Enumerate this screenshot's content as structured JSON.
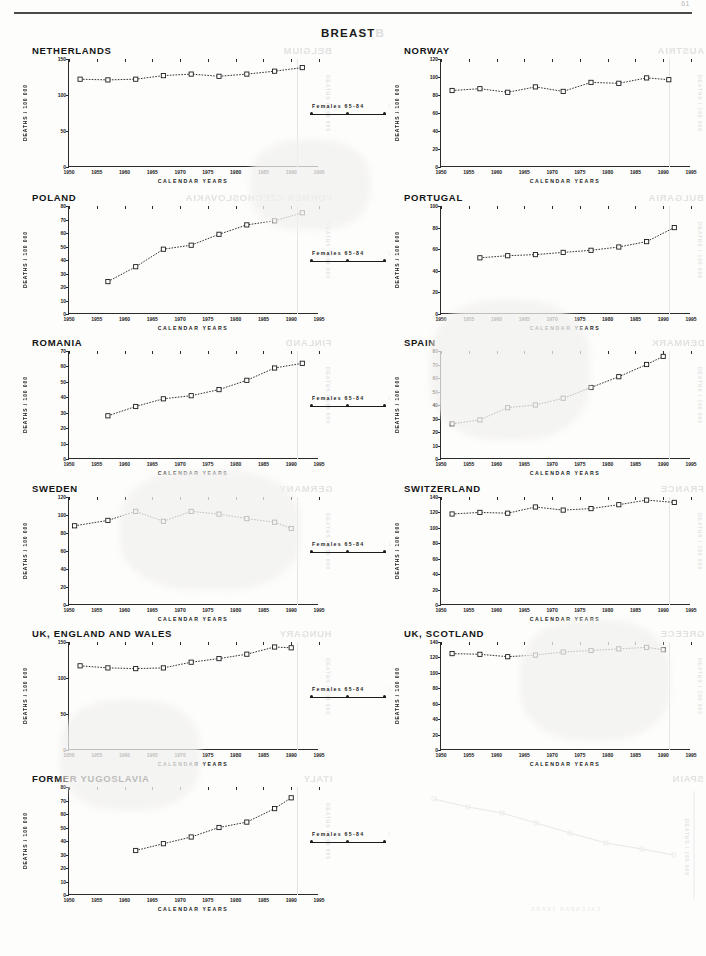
{
  "page": {
    "number": "61",
    "sheet_title": "BREAST",
    "sheet_title_ghost": "B",
    "axis_y_label": "DEATHS / 100 000",
    "axis_x_label": "CALENDAR YEARS",
    "legend_label": "Females 65-84",
    "ink_color": "#1c1c1c",
    "ghost_color": "#e3e3e3"
  },
  "chart_data": [
    {
      "type": "line",
      "title": "NETHERLANDS",
      "ghost_title": "BELGIUM",
      "xlabel": "CALENDAR YEARS",
      "ylabel": "DEATHS / 100 000",
      "xlim": [
        1950,
        1995
      ],
      "ylim": [
        0,
        150
      ],
      "yticks": [
        0,
        50,
        100,
        150
      ],
      "xticks": [
        1950,
        1955,
        1960,
        1965,
        1970,
        1975,
        1980,
        1985,
        1990,
        1995
      ],
      "series": [
        {
          "name": "Females 65-84",
          "x": [
            1952,
            1957,
            1962,
            1967,
            1972,
            1977,
            1982,
            1987,
            1992
          ],
          "values": [
            122,
            121,
            122,
            127,
            129,
            126,
            129,
            133,
            138
          ]
        }
      ]
    },
    {
      "type": "line",
      "title": "NORWAY",
      "ghost_title": "AUSTRIA",
      "xlabel": "CALENDAR YEARS",
      "ylabel": "DEATHS / 100 000",
      "xlim": [
        1950,
        1995
      ],
      "ylim": [
        0,
        120
      ],
      "yticks": [
        0,
        20,
        40,
        60,
        80,
        100,
        120
      ],
      "xticks": [
        1950,
        1955,
        1960,
        1965,
        1970,
        1975,
        1980,
        1985,
        1990,
        1995
      ],
      "series": [
        {
          "name": "Females 65-84",
          "x": [
            1952,
            1957,
            1962,
            1967,
            1972,
            1977,
            1982,
            1987,
            1991
          ],
          "values": [
            85,
            87,
            83,
            89,
            84,
            94,
            93,
            99,
            97
          ]
        }
      ]
    },
    {
      "type": "line",
      "title": "POLAND",
      "ghost_title": "FORMER CZECHOSLOVAKIA",
      "xlabel": "CALENDAR YEARS",
      "ylabel": "DEATHS / 100 000",
      "xlim": [
        1950,
        1995
      ],
      "ylim": [
        0,
        80
      ],
      "yticks": [
        0,
        10,
        20,
        30,
        40,
        50,
        60,
        70,
        80
      ],
      "xticks": [
        1950,
        1955,
        1960,
        1965,
        1970,
        1975,
        1980,
        1985,
        1990,
        1995
      ],
      "series": [
        {
          "name": "Females 65-84",
          "x": [
            1957,
            1962,
            1967,
            1972,
            1977,
            1982,
            1987,
            1992
          ],
          "values": [
            24,
            35,
            48,
            51,
            59,
            66,
            69,
            75
          ]
        }
      ]
    },
    {
      "type": "line",
      "title": "PORTUGAL",
      "ghost_title": "BULGARIA",
      "xlabel": "CALENDAR YEARS",
      "ylabel": "DEATHS / 100 000",
      "xlim": [
        1950,
        1995
      ],
      "ylim": [
        0,
        100
      ],
      "yticks": [
        0,
        20,
        40,
        60,
        80,
        100
      ],
      "xticks": [
        1950,
        1955,
        1960,
        1965,
        1970,
        1975,
        1980,
        1985,
        1990,
        1995
      ],
      "series": [
        {
          "name": "Females 65-84",
          "x": [
            1957,
            1962,
            1967,
            1972,
            1977,
            1982,
            1987,
            1992
          ],
          "values": [
            52,
            54,
            55,
            57,
            59,
            62,
            67,
            80
          ]
        }
      ]
    },
    {
      "type": "line",
      "title": "ROMANIA",
      "ghost_title": "FINLAND",
      "xlabel": "CALENDAR YEARS",
      "ylabel": "DEATHS / 100 000",
      "xlim": [
        1950,
        1995
      ],
      "ylim": [
        0,
        70
      ],
      "yticks": [
        0,
        10,
        20,
        30,
        40,
        50,
        60,
        70
      ],
      "xticks": [
        1950,
        1955,
        1960,
        1965,
        1970,
        1975,
        1980,
        1985,
        1990,
        1995
      ],
      "series": [
        {
          "name": "Females 65-84",
          "x": [
            1957,
            1962,
            1967,
            1972,
            1977,
            1982,
            1987,
            1992
          ],
          "values": [
            28,
            34,
            39,
            41,
            45,
            51,
            59,
            62
          ]
        }
      ]
    },
    {
      "type": "line",
      "title": "SPAIN",
      "ghost_title": "DENMARK",
      "xlabel": "CALENDAR YEARS",
      "ylabel": "DEATHS / 100 000",
      "xlim": [
        1950,
        1995
      ],
      "ylim": [
        0,
        80
      ],
      "yticks": [
        0,
        10,
        20,
        30,
        40,
        50,
        60,
        70,
        80
      ],
      "xticks": [
        1950,
        1955,
        1960,
        1965,
        1970,
        1975,
        1980,
        1985,
        1990,
        1995
      ],
      "series": [
        {
          "name": "Females 65-84",
          "x": [
            1952,
            1957,
            1962,
            1967,
            1972,
            1977,
            1982,
            1987,
            1990
          ],
          "values": [
            26,
            29,
            38,
            40,
            45,
            53,
            61,
            70,
            76
          ]
        }
      ]
    },
    {
      "type": "line",
      "title": "SWEDEN",
      "ghost_title": "GERMANY",
      "xlabel": "CALENDAR YEARS",
      "ylabel": "DEATHS / 100 000",
      "xlim": [
        1950,
        1995
      ],
      "ylim": [
        0,
        120
      ],
      "yticks": [
        0,
        20,
        40,
        60,
        80,
        100,
        120
      ],
      "xticks": [
        1950,
        1955,
        1960,
        1965,
        1970,
        1975,
        1980,
        1985,
        1990,
        1995
      ],
      "series": [
        {
          "name": "Females 65-84",
          "x": [
            1951,
            1957,
            1962,
            1967,
            1972,
            1977,
            1982,
            1987,
            1990
          ],
          "values": [
            88,
            94,
            104,
            93,
            104,
            101,
            96,
            92,
            85
          ]
        }
      ]
    },
    {
      "type": "line",
      "title": "SWITZERLAND",
      "ghost_title": "FRANCE",
      "xlabel": "CALENDAR YEARS",
      "ylabel": "DEATHS / 100 000",
      "xlim": [
        1950,
        1995
      ],
      "ylim": [
        0,
        140
      ],
      "yticks": [
        0,
        20,
        40,
        60,
        80,
        100,
        120,
        140
      ],
      "xticks": [
        1950,
        1955,
        1960,
        1965,
        1970,
        1975,
        1980,
        1985,
        1990,
        1995
      ],
      "series": [
        {
          "name": "Females 65-84",
          "x": [
            1952,
            1957,
            1962,
            1967,
            1972,
            1977,
            1982,
            1987,
            1992
          ],
          "values": [
            118,
            120,
            119,
            127,
            123,
            125,
            130,
            136,
            133
          ]
        }
      ]
    },
    {
      "type": "line",
      "title": "UK, ENGLAND AND WALES",
      "ghost_title": "HUNGARY",
      "xlabel": "CALENDAR YEARS",
      "ylabel": "DEATHS / 100 000",
      "xlim": [
        1950,
        1995
      ],
      "ylim": [
        0,
        150
      ],
      "yticks": [
        0,
        50,
        100,
        150
      ],
      "xticks": [
        1950,
        1955,
        1960,
        1965,
        1970,
        1975,
        1980,
        1985,
        1990,
        1995
      ],
      "series": [
        {
          "name": "Females 65-84",
          "x": [
            1952,
            1957,
            1962,
            1967,
            1972,
            1977,
            1982,
            1987,
            1990
          ],
          "values": [
            117,
            114,
            113,
            114,
            122,
            127,
            133,
            143,
            142
          ]
        }
      ]
    },
    {
      "type": "line",
      "title": "UK, SCOTLAND",
      "ghost_title": "GREECE",
      "xlabel": "CALENDAR YEARS",
      "ylabel": "DEATHS / 100 000",
      "xlim": [
        1950,
        1995
      ],
      "ylim": [
        0,
        140
      ],
      "yticks": [
        0,
        20,
        40,
        60,
        80,
        100,
        120,
        140
      ],
      "xticks": [
        1950,
        1955,
        1960,
        1965,
        1970,
        1975,
        1980,
        1985,
        1990,
        1995
      ],
      "series": [
        {
          "name": "Females 65-84",
          "x": [
            1952,
            1957,
            1962,
            1967,
            1972,
            1977,
            1982,
            1987,
            1990
          ],
          "values": [
            125,
            124,
            121,
            123,
            127,
            129,
            131,
            133,
            130
          ]
        }
      ]
    },
    {
      "type": "line",
      "title": "FORMER YUGOSLAVIA",
      "ghost_title": "ITALY",
      "xlabel": "CALENDAR YEARS",
      "ylabel": "DEATHS / 100 000",
      "xlim": [
        1950,
        1995
      ],
      "ylim": [
        0,
        80
      ],
      "yticks": [
        0,
        10,
        20,
        30,
        40,
        50,
        60,
        70,
        80
      ],
      "xticks": [
        1950,
        1955,
        1960,
        1965,
        1970,
        1975,
        1980,
        1985,
        1990,
        1995
      ],
      "series": [
        {
          "name": "Females 65-84",
          "x": [
            1962,
            1967,
            1972,
            1977,
            1982,
            1987,
            1990
          ],
          "values": [
            33,
            38,
            43,
            50,
            54,
            64,
            72
          ]
        }
      ]
    }
  ],
  "ghost_panels": [
    {
      "title": "SPAIN",
      "note": "reverse-side bleed-through"
    }
  ]
}
